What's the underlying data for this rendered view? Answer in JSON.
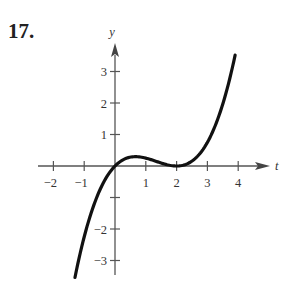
{
  "problem": {
    "number": "17."
  },
  "chart_data": {
    "type": "line",
    "title": "",
    "xlabel": "t",
    "ylabel": "y",
    "xlim": [
      -2.3,
      5.0
    ],
    "ylim": [
      -3.6,
      4.0
    ],
    "x_ticks": [
      -2,
      -1,
      1,
      2,
      3,
      4
    ],
    "x_tick_labels": [
      "−2",
      "−1",
      "1",
      "2",
      "3",
      "4"
    ],
    "y_ticks": [
      3,
      2,
      1,
      -2,
      -3
    ],
    "y_tick_labels": [
      "3",
      "2",
      "1",
      "−2",
      "−3"
    ],
    "y_ticks_unlabeled": [
      -1
    ],
    "grid": false,
    "legend": null,
    "series": [
      {
        "name": "y = f(t)",
        "x": [
          -1.3,
          -1.0,
          -0.5,
          0.0,
          0.5,
          0.67,
          1.0,
          1.5,
          2.0,
          2.5,
          3.0,
          3.5,
          3.9
        ],
        "values": [
          -3.54,
          -2.25,
          -0.78,
          0.0,
          0.28,
          0.3,
          0.25,
          0.09,
          0.0,
          0.16,
          0.75,
          1.97,
          3.52
        ]
      }
    ],
    "colors": {
      "curve": "#111111",
      "axes": "#555555"
    }
  }
}
